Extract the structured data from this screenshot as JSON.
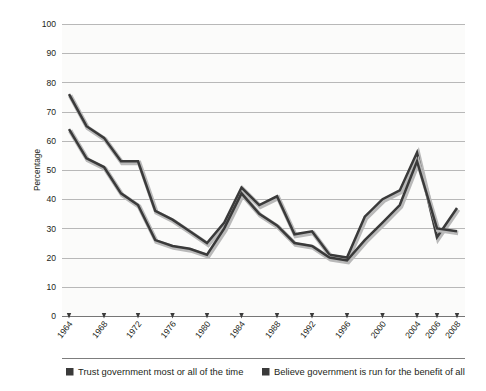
{
  "chart_data": {
    "type": "line",
    "title": "",
    "xlabel": "",
    "ylabel": "Percentage",
    "ylim": [
      0,
      100
    ],
    "ytick_step": 10,
    "yticks": [
      0,
      10,
      20,
      30,
      40,
      50,
      60,
      70,
      80,
      90,
      100
    ],
    "grid": true,
    "legend_position": "bottom",
    "categories": [
      1964,
      1968,
      1972,
      1976,
      1980,
      1984,
      1988,
      1992,
      1996,
      2000,
      2004,
      2006,
      2008
    ],
    "xtick_labels": [
      "1964",
      "1968",
      "1972",
      "1976",
      "1980",
      "1984",
      "1988",
      "1992",
      "1996",
      "2000",
      "2004",
      "2006",
      "2008"
    ],
    "series": [
      {
        "name": "Trust government most or all of the time",
        "color": "#3a3a3a",
        "values": [
          76,
          61,
          53,
          33,
          25,
          44,
          41,
          29,
          20,
          40,
          56,
          27,
          37
        ]
      },
      {
        "name": "Believe government is run for the benefit of all",
        "color": "#3a3a3a",
        "values": [
          64,
          51,
          38,
          24,
          21,
          42,
          31,
          20,
          19,
          32,
          53,
          30,
          29
        ]
      }
    ],
    "series_detail": [
      {
        "name": "Trust government most or all of the time",
        "points": [
          {
            "x": 1964,
            "y": 76
          },
          {
            "x": 1966,
            "y": 65
          },
          {
            "x": 1968,
            "y": 61
          },
          {
            "x": 1970,
            "y": 53
          },
          {
            "x": 1972,
            "y": 53
          },
          {
            "x": 1974,
            "y": 36
          },
          {
            "x": 1976,
            "y": 33
          },
          {
            "x": 1978,
            "y": 29
          },
          {
            "x": 1980,
            "y": 25
          },
          {
            "x": 1982,
            "y": 32
          },
          {
            "x": 1984,
            "y": 44
          },
          {
            "x": 1986,
            "y": 38
          },
          {
            "x": 1988,
            "y": 41
          },
          {
            "x": 1990,
            "y": 28
          },
          {
            "x": 1992,
            "y": 29
          },
          {
            "x": 1994,
            "y": 21
          },
          {
            "x": 1996,
            "y": 20
          },
          {
            "x": 1998,
            "y": 34
          },
          {
            "x": 2000,
            "y": 40
          },
          {
            "x": 2002,
            "y": 43
          },
          {
            "x": 2004,
            "y": 56
          },
          {
            "x": 2006,
            "y": 27
          },
          {
            "x": 2008,
            "y": 37
          }
        ]
      },
      {
        "name": "Believe government is run for the benefit of all",
        "points": [
          {
            "x": 1964,
            "y": 64
          },
          {
            "x": 1966,
            "y": 54
          },
          {
            "x": 1968,
            "y": 51
          },
          {
            "x": 1970,
            "y": 42
          },
          {
            "x": 1972,
            "y": 38
          },
          {
            "x": 1974,
            "y": 26
          },
          {
            "x": 1976,
            "y": 24
          },
          {
            "x": 1978,
            "y": 23
          },
          {
            "x": 1980,
            "y": 21
          },
          {
            "x": 1982,
            "y": 30
          },
          {
            "x": 1984,
            "y": 42
          },
          {
            "x": 1986,
            "y": 35
          },
          {
            "x": 1988,
            "y": 31
          },
          {
            "x": 1990,
            "y": 25
          },
          {
            "x": 1992,
            "y": 24
          },
          {
            "x": 1994,
            "y": 20
          },
          {
            "x": 1996,
            "y": 19
          },
          {
            "x": 1998,
            "y": 26
          },
          {
            "x": 2000,
            "y": 32
          },
          {
            "x": 2002,
            "y": 38
          },
          {
            "x": 2004,
            "y": 53
          },
          {
            "x": 2006,
            "y": 30
          },
          {
            "x": 2008,
            "y": 29
          }
        ]
      }
    ]
  },
  "axis": {
    "ylabel": "Percentage",
    "yticks": [
      "0",
      "10",
      "20",
      "30",
      "40",
      "50",
      "60",
      "70",
      "80",
      "90",
      "100"
    ],
    "xticks": [
      "1964",
      "1968",
      "1972",
      "1976",
      "1980",
      "1984",
      "1988",
      "1992",
      "1996",
      "2000",
      "2004",
      "2006",
      "2008"
    ]
  },
  "legend": {
    "items": [
      {
        "label": "Trust government most or all of the time",
        "swatch": "#3a3a3a"
      },
      {
        "label": "Believe government is run for the benefit of all",
        "swatch": "#3a3a3a"
      }
    ]
  },
  "colors": {
    "series_stroke": "#3a3a3a",
    "gridline": "#9b9b9b",
    "axis": "#6f6f6f",
    "plot_background": "#fbfbfa",
    "text": "#231f20"
  }
}
